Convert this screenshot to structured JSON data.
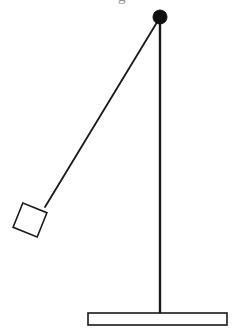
{
  "figure": {
    "background_color": "#ffffff",
    "stroke_color": "#1a1a1a",
    "fill_color": "#ffffff",
    "width": 238,
    "height": 333,
    "cropped_text_fragment": "g"
  },
  "chart_data": {
    "type": "diagram",
    "xlabel": "",
    "ylabel": "",
    "xlim": [
      0,
      238
    ],
    "ylim": [
      0,
      333
    ],
    "grid": false,
    "legend": "none",
    "units": "pixels",
    "elements": [
      {
        "name": "pivot",
        "shape": "filled-circle",
        "cx": 160,
        "cy": 17,
        "r": 7,
        "fill": "#111111",
        "stroke": "#111111"
      },
      {
        "name": "vertical-post",
        "shape": "line",
        "x1": 160,
        "y1": 17,
        "x2": 160,
        "y2": 313,
        "stroke_width": 2.4,
        "stroke": "#1a1a1a"
      },
      {
        "name": "pendulum-string",
        "shape": "line",
        "x1": 159,
        "y1": 19,
        "x2": 45,
        "y2": 207,
        "stroke_width": 1.8,
        "stroke": "#1a1a1a",
        "length_px": 219.9,
        "angle_from_vertical_deg": 31.2
      },
      {
        "name": "pendulum-bob",
        "shape": "square",
        "center_x": 30,
        "center_y": 220,
        "side": 26,
        "rotation_deg": 22,
        "fill": "#ffffff",
        "stroke": "#1a1a1a",
        "stroke_width": 1.6
      },
      {
        "name": "base-platform",
        "shape": "rectangle",
        "x": 88,
        "y": 313,
        "width": 139,
        "height": 12,
        "fill": "#ffffff",
        "stroke": "#1a1a1a",
        "stroke_width": 1.6
      }
    ]
  }
}
